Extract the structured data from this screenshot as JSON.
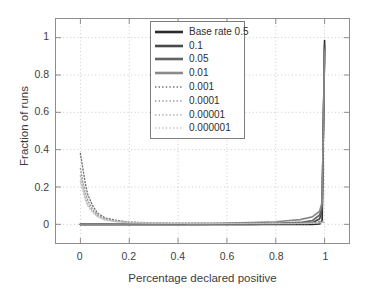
{
  "chart_data": {
    "type": "line",
    "title": "",
    "xlabel": "Percentage declared positive",
    "ylabel": "Fraction of runs",
    "xlim": [
      -0.1,
      1.1
    ],
    "ylim": [
      -0.1,
      1.1
    ],
    "xticks": [
      "0",
      "0.2",
      "0.4",
      "0.6",
      "0.8",
      "1"
    ],
    "xtick_values": [
      0,
      0.2,
      0.4,
      0.6,
      0.8,
      1
    ],
    "yticks": [
      "0",
      "0.2",
      "0.4",
      "0.6",
      "0.8",
      "1"
    ],
    "ytick_values": [
      0,
      0.2,
      0.4,
      0.6,
      0.8,
      1
    ],
    "grid": true,
    "legend_position": "upper center",
    "series": [
      {
        "name": "Base rate 0.5",
        "style": "solid",
        "color": "#2b2b2b",
        "x": [
          0,
          0.05,
          0.1,
          0.2,
          0.3,
          0.4,
          0.5,
          0.6,
          0.7,
          0.8,
          0.9,
          0.95,
          0.98,
          0.99,
          1.0
        ],
        "values": [
          0,
          0,
          0,
          0,
          0,
          0,
          0,
          0,
          0,
          0,
          0,
          0,
          0.002,
          0.02,
          0.985
        ]
      },
      {
        "name": "0.1",
        "style": "solid",
        "color": "#4a4a4a",
        "x": [
          0,
          0.05,
          0.1,
          0.2,
          0.3,
          0.4,
          0.5,
          0.6,
          0.7,
          0.8,
          0.9,
          0.95,
          0.98,
          0.99,
          1.0
        ],
        "values": [
          0,
          0,
          0,
          0,
          0,
          0,
          0,
          0,
          0,
          0.002,
          0.004,
          0.008,
          0.03,
          0.08,
          0.96
        ]
      },
      {
        "name": "0.05",
        "style": "solid",
        "color": "#636363",
        "x": [
          0,
          0.05,
          0.1,
          0.2,
          0.3,
          0.4,
          0.5,
          0.6,
          0.7,
          0.8,
          0.9,
          0.95,
          0.98,
          0.99,
          1.0
        ],
        "values": [
          0,
          0,
          0,
          0,
          0,
          0,
          0,
          0.002,
          0.003,
          0.005,
          0.01,
          0.02,
          0.05,
          0.1,
          0.94
        ]
      },
      {
        "name": "0.01",
        "style": "solid",
        "color": "#8a8a8a",
        "x": [
          0,
          0.05,
          0.1,
          0.2,
          0.3,
          0.4,
          0.5,
          0.6,
          0.7,
          0.8,
          0.9,
          0.95,
          0.98,
          0.99,
          1.0
        ],
        "values": [
          0,
          0,
          0,
          0.002,
          0.002,
          0.003,
          0.004,
          0.006,
          0.009,
          0.014,
          0.025,
          0.04,
          0.07,
          0.12,
          0.93
        ]
      },
      {
        "name": "0.001",
        "style": "dotted",
        "color": "#707070",
        "x": [
          0,
          0.01,
          0.02,
          0.03,
          0.05,
          0.07,
          0.1,
          0.15,
          0.2,
          0.3,
          0.4,
          0.6,
          0.8,
          0.9,
          0.95,
          1.0
        ],
        "values": [
          0.38,
          0.3,
          0.22,
          0.16,
          0.1,
          0.06,
          0.035,
          0.02,
          0.012,
          0.008,
          0.006,
          0.005,
          0.005,
          0.006,
          0.008,
          0.02
        ]
      },
      {
        "name": "0.0001",
        "style": "dotted",
        "color": "#989898",
        "x": [
          0,
          0.01,
          0.02,
          0.03,
          0.05,
          0.07,
          0.1,
          0.15,
          0.2,
          0.3,
          0.4,
          0.6,
          0.8,
          0.9,
          0.95,
          1.0
        ],
        "values": [
          0.3,
          0.23,
          0.17,
          0.13,
          0.08,
          0.05,
          0.03,
          0.018,
          0.011,
          0.007,
          0.006,
          0.005,
          0.005,
          0.006,
          0.007,
          0.015
        ]
      },
      {
        "name": "0.00001",
        "style": "dotted",
        "color": "#b0b0b0",
        "x": [
          0,
          0.01,
          0.02,
          0.03,
          0.05,
          0.07,
          0.1,
          0.15,
          0.2,
          0.3,
          0.4,
          0.6,
          0.8,
          0.9,
          0.95,
          1.0
        ],
        "values": [
          0.26,
          0.2,
          0.15,
          0.11,
          0.07,
          0.045,
          0.026,
          0.015,
          0.01,
          0.007,
          0.005,
          0.004,
          0.004,
          0.005,
          0.006,
          0.012
        ]
      },
      {
        "name": "0.000001",
        "style": "dotted",
        "color": "#c4c4c4",
        "x": [
          0,
          0.01,
          0.02,
          0.03,
          0.05,
          0.07,
          0.1,
          0.15,
          0.2,
          0.3,
          0.4,
          0.6,
          0.8,
          0.9,
          0.95,
          1.0
        ],
        "values": [
          0.23,
          0.18,
          0.13,
          0.1,
          0.065,
          0.04,
          0.023,
          0.013,
          0.009,
          0.006,
          0.005,
          0.004,
          0.004,
          0.004,
          0.005,
          0.01
        ]
      }
    ]
  },
  "style": {
    "axis_color": "#8d8d8d",
    "grid_color": "#c9c9c9",
    "text_color": "#3d3d3d",
    "background": "#ffffff"
  }
}
